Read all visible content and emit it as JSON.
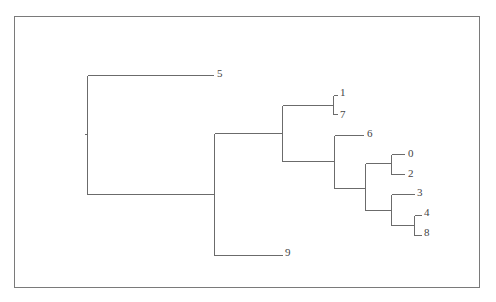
{
  "diagram": {
    "type": "dendrogram",
    "orientation": "left-to-right",
    "leaves": [
      {
        "id": "leaf-5",
        "label": "5"
      },
      {
        "id": "leaf-1",
        "label": "1"
      },
      {
        "id": "leaf-7",
        "label": "7"
      },
      {
        "id": "leaf-6",
        "label": "6"
      },
      {
        "id": "leaf-0",
        "label": "0"
      },
      {
        "id": "leaf-2",
        "label": "2"
      },
      {
        "id": "leaf-3",
        "label": "3"
      },
      {
        "id": "leaf-4",
        "label": "4"
      },
      {
        "id": "leaf-8",
        "label": "8"
      },
      {
        "id": "leaf-9",
        "label": "9"
      }
    ],
    "tree": "(5,(((1,7),(6,((0,2),(3,(4,8))))),9))",
    "colors": {
      "line": "#6b6b6b",
      "text": "#444444",
      "frame": "#7a7a7a"
    }
  }
}
